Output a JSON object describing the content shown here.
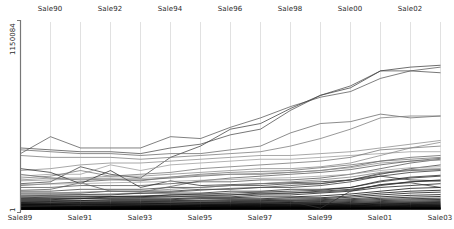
{
  "chart_data": {
    "type": "line",
    "subtype": "parallel-coordinates",
    "title": "",
    "xlabel": "",
    "ylabel": "1150084",
    "grid": true,
    "legend": "none",
    "ylim": [
      1,
      1150084
    ],
    "y_tick_labels": [
      "1150084",
      "1"
    ],
    "axis_top_labels": [
      "Sale90",
      "Sale92",
      "Sale94",
      "Sale96",
      "Sale98",
      "Sale00",
      "Sale02"
    ],
    "axis_bottom_labels": [
      "Sale89",
      "Sale91",
      "Sale93",
      "Sale95",
      "Sale97",
      "Sale99",
      "Sale01",
      "Sale03"
    ],
    "categories": [
      "Sale89",
      "Sale90",
      "Sale91",
      "Sale92",
      "Sale93",
      "Sale94",
      "Sale95",
      "Sale96",
      "Sale97",
      "Sale98",
      "Sale99",
      "Sale00",
      "Sale01",
      "Sale02",
      "Sale03"
    ],
    "axis_x_positions": [
      20,
      50,
      80,
      110,
      140,
      170,
      200,
      230,
      260,
      290,
      320,
      350,
      380,
      410,
      440
    ],
    "plot_top_y": 22,
    "plot_bottom_y": 210,
    "series": [
      {
        "name": "s1",
        "color": "#555555",
        "values": [
          0.3,
          0.39,
          0.33,
          0.33,
          0.33,
          0.39,
          0.38,
          0.44,
          0.49,
          0.55,
          0.6,
          0.63,
          0.7,
          0.74,
          0.76
        ]
      },
      {
        "name": "s2",
        "color": "#4a4a4a",
        "values": [
          0.33,
          0.32,
          0.31,
          0.31,
          0.3,
          0.33,
          0.35,
          0.4,
          0.43,
          0.53,
          0.61,
          0.66,
          0.74,
          0.74,
          0.73
        ]
      },
      {
        "name": "s3",
        "color": "#3d3d3d",
        "values": [
          0.14,
          0.15,
          0.23,
          0.19,
          0.17,
          0.28,
          0.34,
          0.43,
          0.46,
          0.54,
          0.61,
          0.65,
          0.74,
          0.76,
          0.77
        ]
      },
      {
        "name": "s4",
        "color": "#666666",
        "values": [
          0.32,
          0.31,
          0.3,
          0.3,
          0.29,
          0.3,
          0.3,
          0.32,
          0.34,
          0.41,
          0.46,
          0.47,
          0.51,
          0.49,
          0.5
        ]
      },
      {
        "name": "s5",
        "color": "#777777",
        "values": [
          0.29,
          0.28,
          0.28,
          0.28,
          0.27,
          0.28,
          0.29,
          0.3,
          0.31,
          0.34,
          0.38,
          0.43,
          0.49,
          0.5,
          0.5
        ]
      },
      {
        "name": "s6",
        "color": "#8a8a8a",
        "values": [
          0.21,
          0.22,
          0.24,
          0.25,
          0.25,
          0.26,
          0.27,
          0.28,
          0.29,
          0.29,
          0.3,
          0.31,
          0.33,
          0.35,
          0.37
        ]
      },
      {
        "name": "s7",
        "color": "#9a9a9a",
        "values": [
          0.18,
          0.19,
          0.19,
          0.24,
          0.21,
          0.24,
          0.25,
          0.26,
          0.27,
          0.27,
          0.28,
          0.29,
          0.3,
          0.31,
          0.31
        ]
      },
      {
        "name": "s8",
        "color": "#707070",
        "values": [
          0.17,
          0.18,
          0.21,
          0.18,
          0.19,
          0.2,
          0.22,
          0.23,
          0.24,
          0.25,
          0.26,
          0.28,
          0.32,
          0.33,
          0.34
        ]
      },
      {
        "name": "s9",
        "color": "#868686",
        "values": [
          0.16,
          0.17,
          0.17,
          0.18,
          0.18,
          0.19,
          0.2,
          0.21,
          0.22,
          0.22,
          0.23,
          0.25,
          0.29,
          0.33,
          0.36
        ]
      },
      {
        "name": "s10",
        "color": "#5c5c5c",
        "values": [
          0.13,
          0.14,
          0.15,
          0.16,
          0.16,
          0.17,
          0.18,
          0.19,
          0.19,
          0.2,
          0.21,
          0.23,
          0.26,
          0.28,
          0.29
        ]
      },
      {
        "name": "s11",
        "color": "#4f4f4f",
        "values": [
          0.12,
          0.12,
          0.13,
          0.13,
          0.13,
          0.14,
          0.15,
          0.15,
          0.16,
          0.16,
          0.17,
          0.19,
          0.22,
          0.25,
          0.27
        ]
      },
      {
        "name": "s12",
        "color": "#3a3a3a",
        "values": [
          0.1,
          0.1,
          0.11,
          0.11,
          0.11,
          0.12,
          0.12,
          0.13,
          0.13,
          0.14,
          0.14,
          0.16,
          0.19,
          0.22,
          0.24
        ]
      },
      {
        "name": "s13",
        "color": "#2d2d2d",
        "values": [
          0.09,
          0.09,
          0.09,
          0.1,
          0.1,
          0.1,
          0.11,
          0.11,
          0.12,
          0.12,
          0.13,
          0.15,
          0.18,
          0.2,
          0.21
        ]
      },
      {
        "name": "s14",
        "color": "#222222",
        "values": [
          0.08,
          0.08,
          0.08,
          0.08,
          0.09,
          0.09,
          0.09,
          0.1,
          0.1,
          0.11,
          0.11,
          0.12,
          0.15,
          0.17,
          0.18
        ]
      },
      {
        "name": "s15",
        "color": "#1a1a1a",
        "values": [
          0.07,
          0.07,
          0.07,
          0.07,
          0.07,
          0.08,
          0.08,
          0.08,
          0.09,
          0.09,
          0.1,
          0.11,
          0.13,
          0.15,
          0.16
        ]
      },
      {
        "name": "s16",
        "color": "#111111",
        "values": [
          0.06,
          0.06,
          0.06,
          0.07,
          0.07,
          0.07,
          0.07,
          0.07,
          0.08,
          0.08,
          0.09,
          0.1,
          0.12,
          0.13,
          0.14
        ]
      },
      {
        "name": "s17",
        "color": "#000000",
        "values": [
          0.055,
          0.055,
          0.06,
          0.06,
          0.06,
          0.06,
          0.065,
          0.065,
          0.07,
          0.07,
          0.075,
          0.085,
          0.1,
          0.115,
          0.12
        ]
      },
      {
        "name": "s18",
        "color": "#000000",
        "values": [
          0.05,
          0.05,
          0.05,
          0.055,
          0.055,
          0.055,
          0.06,
          0.06,
          0.06,
          0.065,
          0.065,
          0.075,
          0.09,
          0.1,
          0.105
        ]
      },
      {
        "name": "s19",
        "color": "#0a0a0a",
        "values": [
          0.045,
          0.045,
          0.048,
          0.05,
          0.05,
          0.05,
          0.052,
          0.055,
          0.055,
          0.058,
          0.06,
          0.068,
          0.08,
          0.09,
          0.095
        ]
      },
      {
        "name": "s20",
        "color": "#000000",
        "values": [
          0.04,
          0.042,
          0.043,
          0.045,
          0.045,
          0.046,
          0.048,
          0.05,
          0.05,
          0.052,
          0.055,
          0.06,
          0.07,
          0.078,
          0.082
        ]
      },
      {
        "name": "s21",
        "color": "#000000",
        "values": [
          0.038,
          0.038,
          0.04,
          0.04,
          0.041,
          0.042,
          0.043,
          0.045,
          0.046,
          0.048,
          0.05,
          0.055,
          0.062,
          0.068,
          0.072
        ]
      },
      {
        "name": "s22",
        "color": "#050505",
        "values": [
          0.035,
          0.035,
          0.036,
          0.037,
          0.038,
          0.038,
          0.04,
          0.04,
          0.042,
          0.043,
          0.045,
          0.05,
          0.056,
          0.06,
          0.063
        ]
      },
      {
        "name": "s23",
        "color": "#000000",
        "values": [
          0.032,
          0.032,
          0.033,
          0.034,
          0.034,
          0.035,
          0.036,
          0.037,
          0.038,
          0.04,
          0.041,
          0.045,
          0.05,
          0.054,
          0.056
        ]
      },
      {
        "name": "s24",
        "color": "#000000",
        "values": [
          0.03,
          0.03,
          0.031,
          0.031,
          0.032,
          0.032,
          0.033,
          0.034,
          0.035,
          0.036,
          0.037,
          0.04,
          0.045,
          0.048,
          0.05
        ]
      },
      {
        "name": "s25",
        "color": "#000000",
        "values": [
          0.028,
          0.028,
          0.028,
          0.029,
          0.029,
          0.03,
          0.03,
          0.031,
          0.032,
          0.033,
          0.034,
          0.036,
          0.04,
          0.043,
          0.045
        ]
      },
      {
        "name": "s26",
        "color": "#000000",
        "values": [
          0.026,
          0.026,
          0.026,
          0.027,
          0.027,
          0.027,
          0.028,
          0.029,
          0.029,
          0.03,
          0.031,
          0.033,
          0.036,
          0.039,
          0.04
        ]
      },
      {
        "name": "s27",
        "color": "#000000",
        "values": [
          0.024,
          0.024,
          0.024,
          0.025,
          0.025,
          0.025,
          0.026,
          0.026,
          0.027,
          0.028,
          0.028,
          0.03,
          0.033,
          0.035,
          0.036
        ]
      },
      {
        "name": "s28",
        "color": "#000000",
        "values": [
          0.022,
          0.022,
          0.022,
          0.023,
          0.023,
          0.023,
          0.024,
          0.024,
          0.025,
          0.025,
          0.026,
          0.027,
          0.03,
          0.032,
          0.033
        ]
      },
      {
        "name": "s29",
        "color": "#000000",
        "values": [
          0.02,
          0.02,
          0.021,
          0.021,
          0.021,
          0.021,
          0.022,
          0.022,
          0.023,
          0.023,
          0.024,
          0.025,
          0.027,
          0.029,
          0.03
        ]
      },
      {
        "name": "s30",
        "color": "#000000",
        "values": [
          0.018,
          0.018,
          0.019,
          0.019,
          0.019,
          0.019,
          0.02,
          0.02,
          0.021,
          0.021,
          0.022,
          0.023,
          0.025,
          0.026,
          0.027
        ]
      },
      {
        "name": "s31",
        "color": "#000000",
        "values": [
          0.017,
          0.017,
          0.017,
          0.017,
          0.018,
          0.018,
          0.018,
          0.018,
          0.019,
          0.019,
          0.02,
          0.021,
          0.022,
          0.024,
          0.024
        ]
      },
      {
        "name": "s32",
        "color": "#000000",
        "values": [
          0.015,
          0.015,
          0.015,
          0.016,
          0.016,
          0.016,
          0.016,
          0.017,
          0.017,
          0.017,
          0.018,
          0.019,
          0.02,
          0.021,
          0.022
        ]
      },
      {
        "name": "s33",
        "color": "#000000",
        "values": [
          0.014,
          0.014,
          0.014,
          0.014,
          0.014,
          0.015,
          0.015,
          0.015,
          0.015,
          0.016,
          0.016,
          0.017,
          0.018,
          0.019,
          0.019
        ]
      },
      {
        "name": "s34",
        "color": "#000000",
        "values": [
          0.012,
          0.012,
          0.013,
          0.013,
          0.013,
          0.013,
          0.013,
          0.014,
          0.014,
          0.014,
          0.015,
          0.015,
          0.016,
          0.017,
          0.017
        ]
      },
      {
        "name": "s35",
        "color": "#000000",
        "values": [
          0.011,
          0.011,
          0.011,
          0.011,
          0.012,
          0.012,
          0.012,
          0.012,
          0.012,
          0.013,
          0.013,
          0.014,
          0.014,
          0.015,
          0.015
        ]
      },
      {
        "name": "s36",
        "color": "#000000",
        "values": [
          0.01,
          0.01,
          0.01,
          0.01,
          0.01,
          0.011,
          0.011,
          0.011,
          0.011,
          0.011,
          0.012,
          0.012,
          0.013,
          0.013,
          0.014
        ]
      },
      {
        "name": "s37",
        "color": "#000000",
        "values": [
          0.009,
          0.009,
          0.009,
          0.009,
          0.009,
          0.009,
          0.01,
          0.01,
          0.01,
          0.01,
          0.01,
          0.011,
          0.011,
          0.012,
          0.012
        ]
      },
      {
        "name": "s38",
        "color": "#000000",
        "values": [
          0.008,
          0.008,
          0.008,
          0.008,
          0.008,
          0.008,
          0.008,
          0.009,
          0.009,
          0.009,
          0.009,
          0.009,
          0.01,
          0.01,
          0.011
        ]
      },
      {
        "name": "s39",
        "color": "#000000",
        "values": [
          0.007,
          0.007,
          0.007,
          0.007,
          0.007,
          0.007,
          0.007,
          0.008,
          0.008,
          0.008,
          0.008,
          0.008,
          0.009,
          0.009,
          0.009
        ]
      },
      {
        "name": "s40",
        "color": "#000000",
        "values": [
          0.006,
          0.006,
          0.006,
          0.006,
          0.006,
          0.006,
          0.006,
          0.007,
          0.007,
          0.007,
          0.007,
          0.007,
          0.008,
          0.008,
          0.008
        ]
      },
      {
        "name": "s41",
        "color": "#000000",
        "values": [
          0.005,
          0.005,
          0.005,
          0.005,
          0.005,
          0.005,
          0.006,
          0.006,
          0.006,
          0.006,
          0.006,
          0.006,
          0.007,
          0.007,
          0.007
        ]
      },
      {
        "name": "s42",
        "color": "#000000",
        "values": [
          0.004,
          0.004,
          0.004,
          0.005,
          0.005,
          0.005,
          0.005,
          0.005,
          0.005,
          0.005,
          0.005,
          0.006,
          0.006,
          0.006,
          0.006
        ]
      },
      {
        "name": "s43",
        "color": "#000000",
        "values": [
          0.004,
          0.004,
          0.004,
          0.004,
          0.004,
          0.004,
          0.004,
          0.004,
          0.004,
          0.005,
          0.005,
          0.005,
          0.005,
          0.005,
          0.005
        ]
      },
      {
        "name": "s44",
        "color": "#000000",
        "values": [
          0.003,
          0.003,
          0.003,
          0.003,
          0.003,
          0.003,
          0.004,
          0.004,
          0.004,
          0.004,
          0.004,
          0.004,
          0.004,
          0.004,
          0.004
        ]
      },
      {
        "name": "s45",
        "color": "#2a2a2a",
        "values": [
          0.22,
          0.2,
          0.14,
          0.21,
          0.12,
          0.155,
          0.13,
          0.135,
          0.14,
          0.145,
          0.15,
          0.16,
          0.18,
          0.16,
          0.155
        ]
      },
      {
        "name": "s46",
        "color": "#6e6e6e",
        "values": [
          0.19,
          0.17,
          0.16,
          0.165,
          0.155,
          0.175,
          0.19,
          0.2,
          0.205,
          0.21,
          0.225,
          0.24,
          0.26,
          0.27,
          0.28
        ]
      },
      {
        "name": "s47",
        "color": "#8f8f8f",
        "values": [
          0.155,
          0.16,
          0.165,
          0.17,
          0.168,
          0.175,
          0.185,
          0.19,
          0.195,
          0.2,
          0.21,
          0.225,
          0.25,
          0.26,
          0.265
        ]
      },
      {
        "name": "s48",
        "color": "#555555",
        "values": [
          0.105,
          0.11,
          0.145,
          0.1,
          0.095,
          0.125,
          0.155,
          0.17,
          0.18,
          0.19,
          0.2,
          0.215,
          0.24,
          0.26,
          0.275
        ]
      },
      {
        "name": "s49",
        "color": "#7d7d7d",
        "values": [
          0.09,
          0.09,
          0.095,
          0.1,
          0.1,
          0.11,
          0.12,
          0.13,
          0.14,
          0.15,
          0.16,
          0.175,
          0.2,
          0.215,
          0.22
        ]
      },
      {
        "name": "s50",
        "color": "#444444",
        "values": [
          0.075,
          0.078,
          0.082,
          0.085,
          0.088,
          0.095,
          0.105,
          0.115,
          0.12,
          0.13,
          0.14,
          0.16,
          0.195,
          0.21,
          0.215
        ]
      },
      {
        "name": "s51",
        "color": "#1f1f1f",
        "values": [
          0.065,
          0.068,
          0.07,
          0.072,
          0.075,
          0.08,
          0.085,
          0.09,
          0.095,
          0.1,
          0.105,
          0.12,
          0.155,
          0.175,
          0.185
        ]
      },
      {
        "name": "s52",
        "color": "#333333",
        "values": [
          0.02,
          0.022,
          0.024,
          0.026,
          0.028,
          0.03,
          0.033,
          0.036,
          0.04,
          0.045,
          0.01,
          0.1,
          0.135,
          0.145,
          0.12
        ]
      },
      {
        "name": "s53",
        "color": "#2f2f2f",
        "values": [
          0.06,
          0.06,
          0.062,
          0.064,
          0.066,
          0.07,
          0.075,
          0.08,
          0.085,
          0.09,
          0.095,
          0.105,
          0.135,
          0.15,
          0.155
        ]
      },
      {
        "name": "s54",
        "color": "#9e9e9e",
        "values": [
          0.135,
          0.138,
          0.14,
          0.145,
          0.148,
          0.152,
          0.158,
          0.162,
          0.168,
          0.172,
          0.18,
          0.19,
          0.21,
          0.225,
          0.23
        ]
      }
    ]
  },
  "canvas": {
    "width": 454,
    "height": 229,
    "background": "#ffffff",
    "grid_color": "#cccccc",
    "axis_color": "#9a9a9a",
    "text_color": "#2b2b2b"
  }
}
